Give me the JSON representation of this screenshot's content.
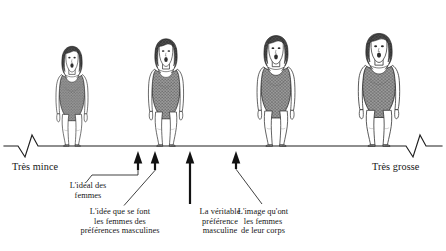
{
  "figure": {
    "type": "diagram",
    "axis": {
      "left_label": "Très mince",
      "right_label": "Très grosse",
      "y": 146,
      "break_left": true,
      "break_right": true
    },
    "silhouettes": [
      {
        "id": "silhouette-1",
        "x": 72,
        "scale": 0.93,
        "order": 1
      },
      {
        "id": "silhouette-2",
        "x": 166,
        "scale": 1.0,
        "order": 2
      },
      {
        "id": "silhouette-3",
        "x": 276,
        "scale": 1.07,
        "order": 3
      },
      {
        "id": "silhouette-4",
        "x": 379,
        "scale": 1.14,
        "order": 4
      }
    ],
    "markers": [
      {
        "id": "marker-ideal",
        "x": 138,
        "label": "L'idéal des\nfemmes",
        "leader": "elbow-left"
      },
      {
        "id": "marker-idee-preferences-masculines",
        "x": 155,
        "label": "L'idée que se font\nles femmes des\npréférences masculines",
        "leader": "diagonal-left"
      },
      {
        "id": "marker-veritable-preference-masculine",
        "x": 190,
        "label": "La véritable\npréférence\nmasculine",
        "leader": "vertical"
      },
      {
        "id": "marker-image-corps",
        "x": 236,
        "label": "L'image qu'ont\nles femmes\nde leur corps",
        "leader": "diagonal-right"
      }
    ],
    "colors": {
      "ink": "#161616",
      "line": "#2a2a2a",
      "swimsuit": "#8d8d8d",
      "hair": "#4a4a4a",
      "skin": "#ffffff",
      "background": "#ffffff"
    }
  }
}
